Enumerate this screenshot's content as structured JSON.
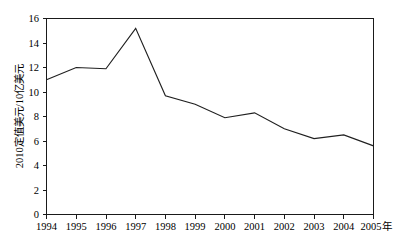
{
  "chart_data": {
    "type": "line",
    "title": "",
    "subtitle": "",
    "xlabel": "年",
    "ylabel": "2010定值美元/10亿美元",
    "categories": [
      "1994",
      "1995",
      "1996",
      "1997",
      "1998",
      "1999",
      "2000",
      "2001",
      "2002",
      "2003",
      "2004",
      "2005"
    ],
    "x": [
      1994,
      1995,
      1996,
      1997,
      1998,
      1999,
      2000,
      2001,
      2002,
      2003,
      2004,
      2005
    ],
    "values": [
      11.0,
      12.0,
      11.9,
      15.2,
      9.7,
      9.0,
      7.9,
      8.3,
      7.0,
      6.2,
      6.5,
      5.6
    ],
    "series": [
      {
        "name": "",
        "values": [
          11.0,
          12.0,
          11.9,
          15.2,
          9.7,
          9.0,
          7.9,
          8.3,
          7.0,
          6.2,
          6.5,
          5.6
        ]
      }
    ],
    "ylim": [
      0,
      16
    ],
    "yticks": [
      0,
      2,
      4,
      6,
      8,
      10,
      12,
      14,
      16
    ],
    "ytick_labels": [
      "0",
      "2",
      "4",
      "6",
      "8",
      "10",
      "12",
      "14",
      "16"
    ],
    "xlim": [
      1994,
      2005
    ],
    "grid": false,
    "legend": null,
    "legend_position": "none",
    "line_color": "#1f1f1f",
    "axis_color": "#1a1a1a",
    "background_color": "#ffffff",
    "annotations": []
  }
}
